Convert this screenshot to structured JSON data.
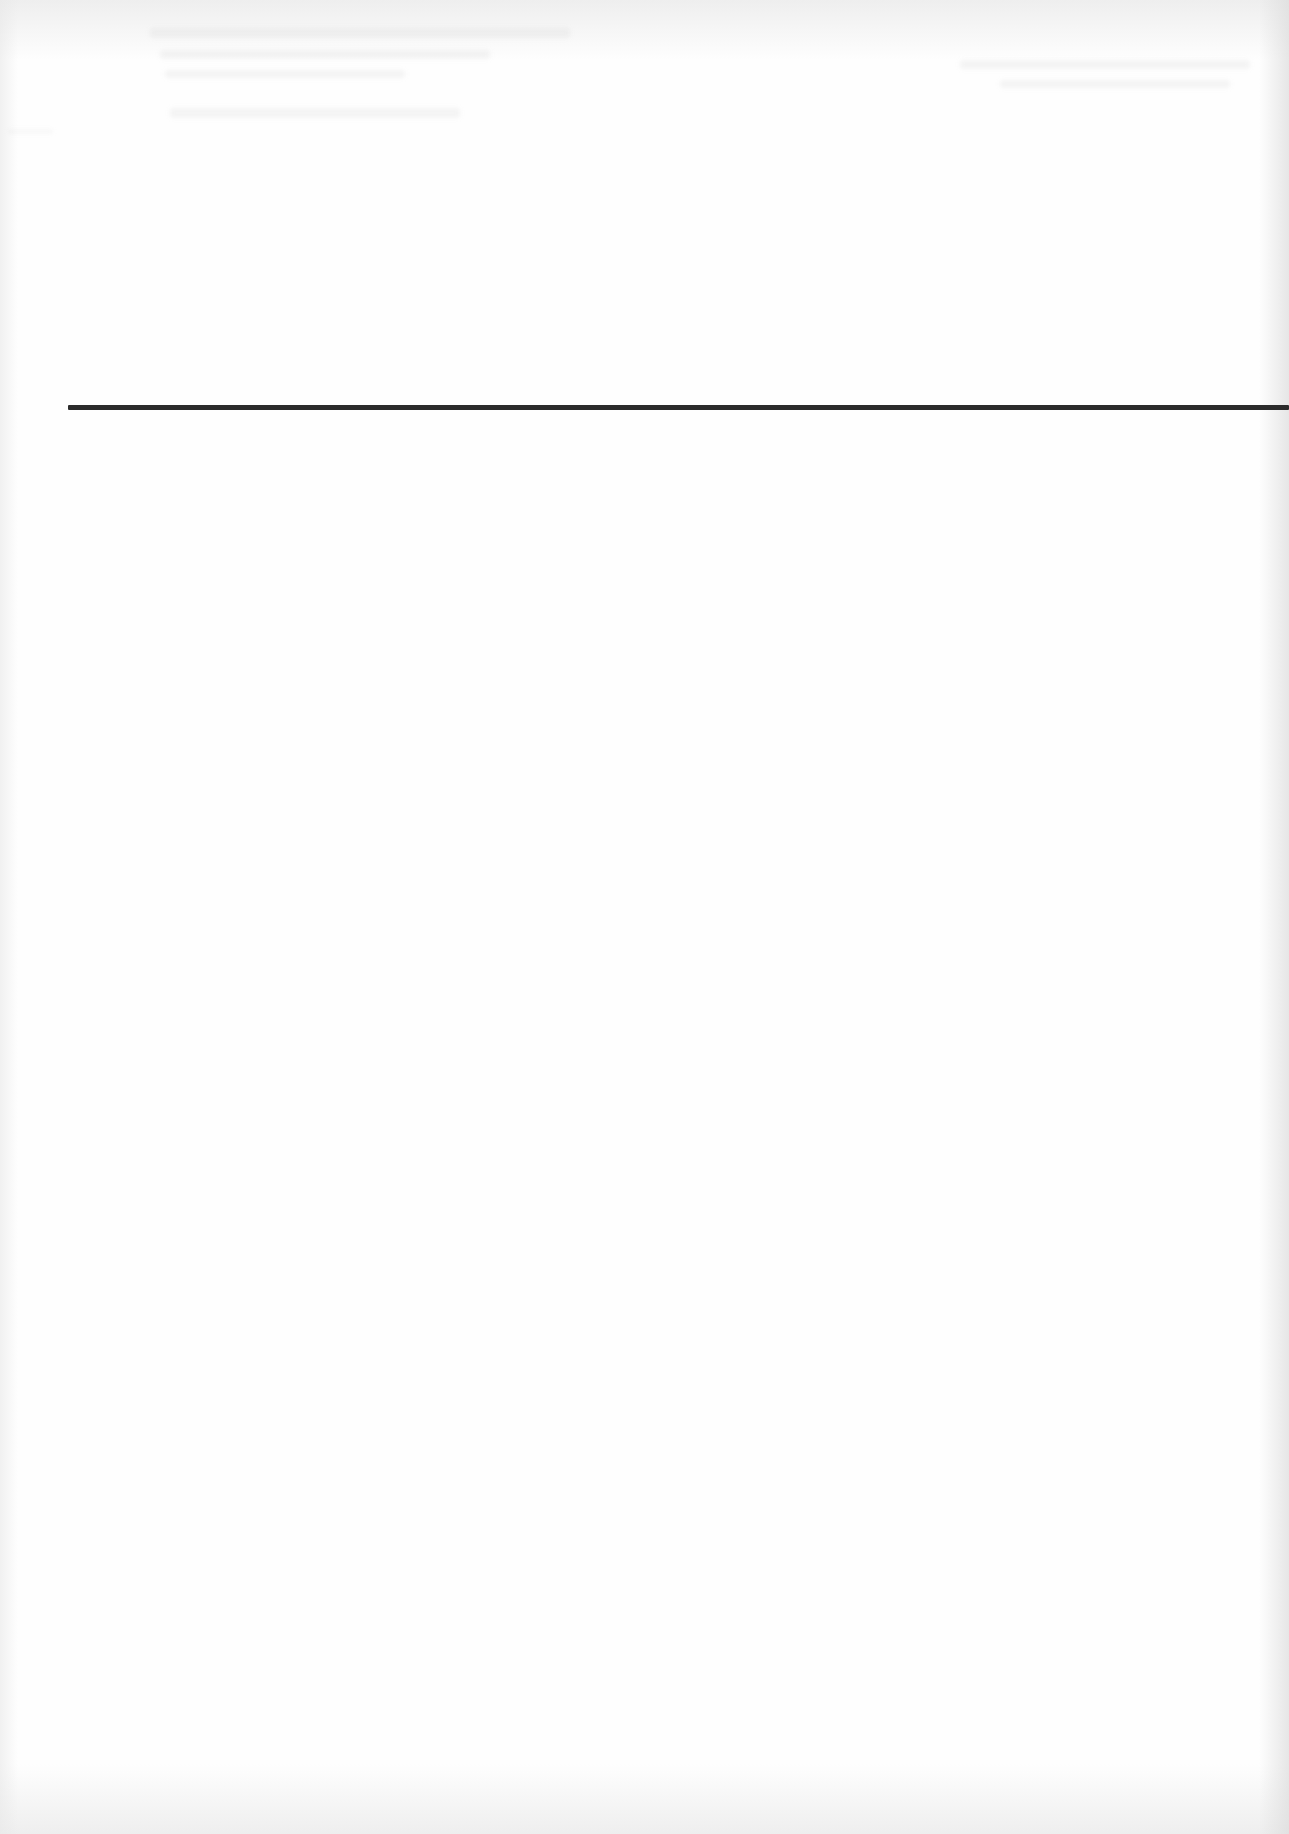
{
  "document": {
    "type": "scanned-page",
    "background_color": "#fefefe",
    "visible_text": [],
    "horizontal_rule": {
      "color": "#2b2b2b",
      "thickness_px": 5,
      "y_px": 407,
      "x_start_px": 68,
      "x_end_px": 1289
    }
  }
}
